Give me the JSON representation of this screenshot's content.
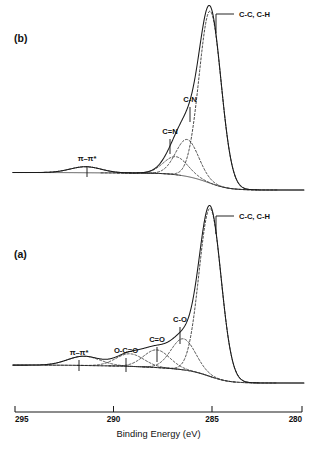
{
  "figure": {
    "type": "xps-spectrum-figure",
    "width": 320,
    "height": 456,
    "background_color": "#ffffff",
    "ink_color": "#1a1a1a"
  },
  "axis": {
    "title": "Binding Energy (eV)",
    "tick_labels": [
      "295",
      "290",
      "285",
      "280"
    ],
    "tick_values": [
      295,
      290,
      285,
      280
    ],
    "min": 280,
    "max": 295,
    "reversed": true,
    "label_x_positions": [
      15,
      113.5,
      212,
      302
    ],
    "axis_y": 412,
    "tick_length": 6
  },
  "panels": [
    {
      "id": "panel-b",
      "label": "(b)",
      "label_x": 14,
      "label_y": 42,
      "baseline_y": 190,
      "top_y": 18,
      "peak_labels": [
        {
          "name": "pi-pi-star",
          "text": "π–π*",
          "text_x": 87,
          "text_y": 161,
          "leader": "vertical",
          "leader_x": 87,
          "leader_y1": 166,
          "leader_y2": 177
        },
        {
          "name": "c-double-n",
          "text": "C=N",
          "text_x": 170,
          "text_y": 134,
          "leader": "vertical",
          "leader_x": 170,
          "leader_y1": 139,
          "leader_y2": 154
        },
        {
          "name": "c-n",
          "text": "C-N",
          "text_x": 190,
          "text_y": 102,
          "leader": "vertical",
          "leader_x": 190,
          "leader_y1": 107,
          "leader_y2": 122
        },
        {
          "name": "c-c-c-h",
          "text": "C-C, C-H",
          "text_x": 239,
          "text_y": 17,
          "leader": "elbow",
          "leader_x": 216,
          "leader_y1": 33,
          "leader_y2": 14,
          "leader_x2": 234
        }
      ]
    },
    {
      "id": "panel-a",
      "label": "(a)",
      "label_x": 14,
      "label_y": 258,
      "baseline_y": 383,
      "top_y": 215,
      "peak_labels": [
        {
          "name": "pi-pi-star",
          "text": "π–π*",
          "text_x": 79,
          "text_y": 355,
          "leader": "vertical",
          "leader_x": 79,
          "leader_y1": 360,
          "leader_y2": 371
        },
        {
          "name": "o-c-double-o",
          "text": "O-C=O",
          "text_x": 126,
          "text_y": 353,
          "leader": "vertical",
          "leader_x": 126,
          "leader_y1": 358,
          "leader_y2": 372
        },
        {
          "name": "c-double-o",
          "text": "C=O",
          "text_x": 157,
          "text_y": 342,
          "leader": "vertical",
          "leader_x": 157,
          "leader_y1": 347,
          "leader_y2": 362
        },
        {
          "name": "c-o",
          "text": "C-O",
          "text_x": 180,
          "text_y": 322,
          "leader": "vertical",
          "leader_x": 180,
          "leader_y1": 327,
          "leader_y2": 344
        },
        {
          "name": "c-c-c-h",
          "text": "C-C, C-H",
          "text_x": 239,
          "text_y": 219,
          "leader": "elbow",
          "leader_x": 216,
          "leader_y1": 234,
          "leader_y2": 216,
          "leader_x2": 234
        }
      ]
    }
  ],
  "chart_data": {
    "type": "line",
    "title": "",
    "xlabel": "Binding Energy (eV)",
    "ylabel": "",
    "xlim": [
      295,
      280
    ],
    "x_axis_reversed": true,
    "grid": false,
    "legend": "none",
    "panels": [
      {
        "name": "(b)",
        "description": "C 1s XPS spectrum, plasma-treated / nitrogen-containing surface",
        "components": [
          {
            "label": "π–π*",
            "center_ev": 291.3,
            "amplitude": 0.035,
            "fwhm_ev": 1.9,
            "style": "dashed"
          },
          {
            "label": "C=N",
            "center_ev": 286.6,
            "amplitude": 0.105,
            "fwhm_ev": 1.5,
            "style": "dashed"
          },
          {
            "label": "C-N",
            "center_ev": 286.0,
            "amplitude": 0.215,
            "fwhm_ev": 1.4,
            "style": "dashed"
          },
          {
            "label": "C-C, C-H",
            "center_ev": 284.8,
            "amplitude": 1.0,
            "fwhm_ev": 1.35,
            "style": "dashed"
          }
        ],
        "envelope": "sum of components plus background",
        "background": "smooth Shirley-type step rising toward high binding energy"
      },
      {
        "name": "(a)",
        "description": "C 1s XPS spectrum, oxidized surface",
        "components": [
          {
            "label": "π–π*",
            "center_ev": 291.4,
            "amplitude": 0.055,
            "fwhm_ev": 2.0,
            "style": "dashed"
          },
          {
            "label": "O-C=O",
            "center_ev": 289.0,
            "amplitude": 0.075,
            "fwhm_ev": 1.7,
            "style": "dashed"
          },
          {
            "label": "C=O",
            "center_ev": 287.6,
            "amplitude": 0.105,
            "fwhm_ev": 1.6,
            "style": "dashed"
          },
          {
            "label": "C-O",
            "center_ev": 286.2,
            "amplitude": 0.185,
            "fwhm_ev": 1.5,
            "style": "dashed"
          },
          {
            "label": "C-C, C-H",
            "center_ev": 284.8,
            "amplitude": 1.0,
            "fwhm_ev": 1.35,
            "style": "dashed"
          }
        ],
        "envelope": "sum of components plus background",
        "background": "smooth Shirley-type step rising toward high binding energy"
      }
    ]
  }
}
